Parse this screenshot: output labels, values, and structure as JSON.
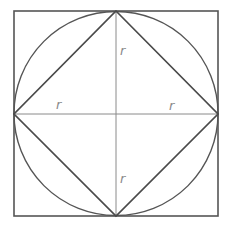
{
  "diagram": {
    "shapes": [
      "outer-square",
      "circle",
      "inscribed-diamond",
      "horizontal-diameter",
      "vertical-diameter"
    ],
    "labels": {
      "top": "r",
      "bottom": "r",
      "left": "r",
      "right": "r"
    },
    "colors": {
      "outline": "#555555",
      "diamond": "#4a4a4a",
      "axis": "#8a8a8a",
      "label": "#8a8a8a"
    }
  }
}
